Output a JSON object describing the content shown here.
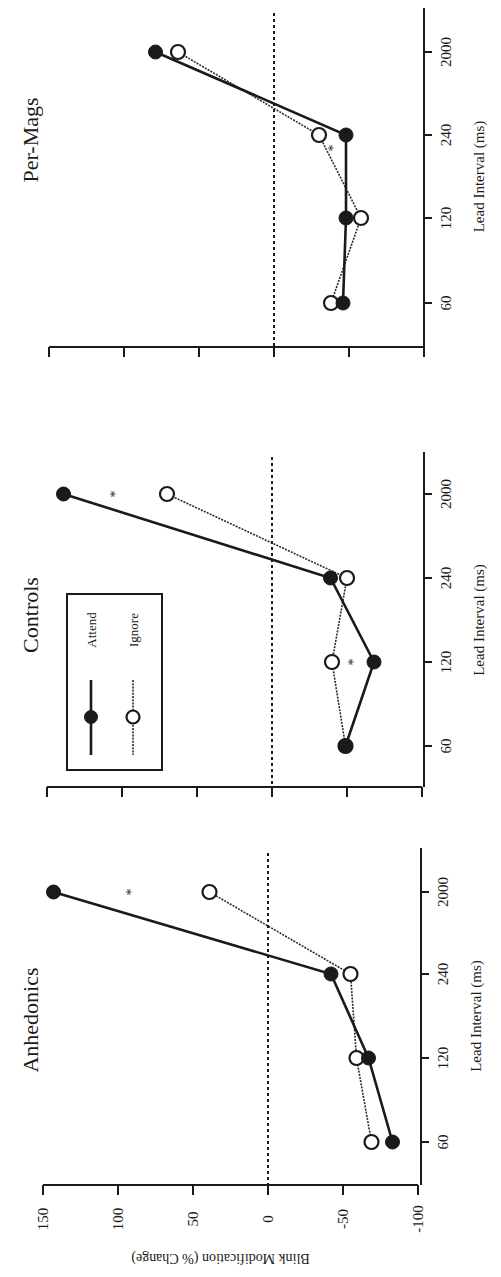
{
  "chart_data": {
    "type": "line",
    "orientation": "rotated-90-ccw",
    "ylabel": "Blink Modification (% Change)",
    "xlabel": "Lead Interval (ms)",
    "ylim": [
      -100,
      150
    ],
    "yticks": [
      150,
      100,
      50,
      0,
      -50,
      -100
    ],
    "categories": [
      "60",
      "120",
      "240",
      "2000"
    ],
    "reference_line": {
      "y": 0,
      "style": "dashed"
    },
    "legend": {
      "panel": "Controls",
      "entries": [
        {
          "label": "Attend",
          "marker": "filled-circle",
          "line": "solid"
        },
        {
          "label": "Ignore",
          "marker": "open-circle",
          "line": "dotted"
        }
      ]
    },
    "panels": [
      {
        "title": "Anhedonics",
        "series": [
          {
            "name": "Attend",
            "values": [
              -83,
              -67,
              -42,
              143
            ]
          },
          {
            "name": "Ignore",
            "values": [
              -69,
              -59,
              -55,
              39
            ]
          }
        ],
        "significance": [
          {
            "category": "2000",
            "label": "*"
          }
        ]
      },
      {
        "title": "Controls",
        "series": [
          {
            "name": "Attend",
            "values": [
              -49,
              -68,
              -39,
              139
            ]
          },
          {
            "name": "Ignore",
            "values": [
              -49,
              -40,
              -50,
              70
            ]
          }
        ],
        "significance": [
          {
            "category": "120",
            "label": "*"
          },
          {
            "category": "2000",
            "label": "*"
          }
        ]
      },
      {
        "title": "Per-Mags",
        "series": [
          {
            "name": "Attend",
            "values": [
              -46,
              -48,
              -48,
              79
            ]
          },
          {
            "name": "Ignore",
            "values": [
              -38,
              -58,
              -30,
              64
            ]
          }
        ],
        "significance": [
          {
            "category": "240",
            "label": "*"
          }
        ]
      }
    ]
  }
}
